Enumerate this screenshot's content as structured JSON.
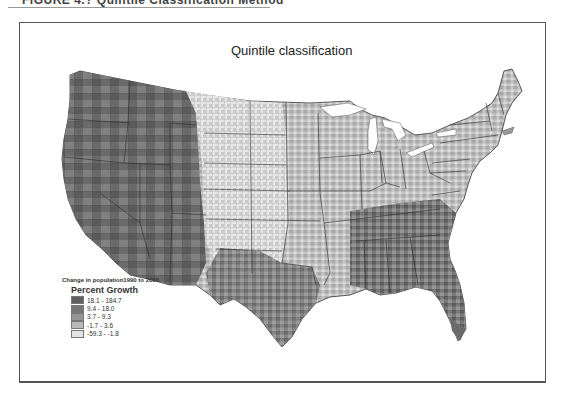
{
  "figure": {
    "caption": "FIGURE 4.? Quintile Classification Method"
  },
  "map": {
    "title": "Quintile classification",
    "region": "Contiguous United States, county level",
    "variable": "Change in population 1990 to 2000"
  },
  "legend": {
    "subtitle": "Change in population1990 to 2000",
    "title": "Percent Growth",
    "classes": [
      {
        "label": "18.1 - 184.7",
        "color": "#5e5e5e"
      },
      {
        "label": "9.4 - 18.0",
        "color": "#777777"
      },
      {
        "label": "3.7 - 9.3",
        "color": "#959595"
      },
      {
        "label": "-1.7 - 3.6",
        "color": "#b7b7b7"
      },
      {
        "label": "-59.3 - -1.8",
        "color": "#e3e3e3"
      }
    ]
  },
  "colors": {
    "frame_border": "#555555",
    "state_border": "#333333",
    "background": "#ffffff"
  }
}
